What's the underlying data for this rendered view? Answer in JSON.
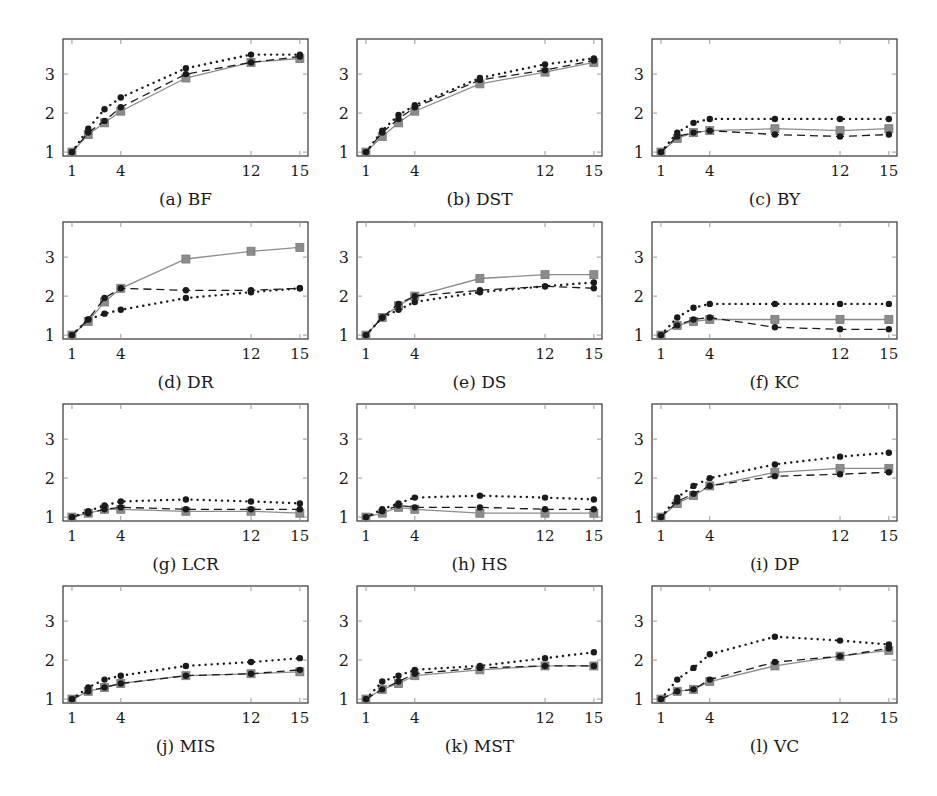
{
  "figure": {
    "layout": {
      "rows": 4,
      "cols": 3
    },
    "x_ticks": [
      1,
      4,
      12,
      15
    ],
    "y_ticks": [
      1,
      2,
      3
    ],
    "x_range": [
      0.45,
      15.5
    ],
    "y_range": [
      0.9,
      3.9
    ],
    "series_styles": [
      {
        "name": "series-solid",
        "line": "solid",
        "marker": "square",
        "color": "#8c8c8c"
      },
      {
        "name": "series-dashed",
        "line": "dashed",
        "marker": "circle",
        "color": "#1a1a1a"
      },
      {
        "name": "series-dotted",
        "line": "dotted",
        "marker": "circle",
        "color": "#1a1a1a"
      }
    ]
  },
  "chart_data": [
    {
      "type": "line",
      "title": "(a) BF",
      "xlabel": "",
      "ylabel": "",
      "xticks": [
        1,
        4,
        12,
        15
      ],
      "yticks": [
        1,
        2,
        3
      ],
      "ylim": [
        0.9,
        3.9
      ],
      "grid": false,
      "x": [
        1,
        2,
        3,
        4,
        8,
        12,
        15
      ],
      "series": [
        {
          "name": "solid-square",
          "values": [
            1.0,
            1.45,
            1.75,
            2.05,
            2.9,
            3.3,
            3.4
          ]
        },
        {
          "name": "dashed-circle",
          "values": [
            1.0,
            1.5,
            1.8,
            2.15,
            3.0,
            3.3,
            3.45
          ]
        },
        {
          "name": "dotted-circle",
          "values": [
            1.0,
            1.6,
            2.1,
            2.4,
            3.15,
            3.5,
            3.5
          ]
        }
      ]
    },
    {
      "type": "line",
      "title": "(b) DST",
      "xlabel": "",
      "ylabel": "",
      "xticks": [
        1,
        4,
        12,
        15
      ],
      "yticks": [
        1,
        2,
        3
      ],
      "ylim": [
        0.9,
        3.9
      ],
      "grid": false,
      "x": [
        1,
        2,
        3,
        4,
        8,
        12,
        15
      ],
      "series": [
        {
          "name": "solid-square",
          "values": [
            1.0,
            1.4,
            1.75,
            2.05,
            2.75,
            3.05,
            3.3
          ]
        },
        {
          "name": "dashed-circle",
          "values": [
            1.0,
            1.5,
            1.85,
            2.15,
            2.85,
            3.1,
            3.35
          ]
        },
        {
          "name": "dotted-circle",
          "values": [
            1.0,
            1.55,
            1.95,
            2.2,
            2.9,
            3.25,
            3.4
          ]
        }
      ]
    },
    {
      "type": "line",
      "title": "(c) BY",
      "xlabel": "",
      "ylabel": "",
      "xticks": [
        1,
        4,
        12,
        15
      ],
      "yticks": [
        1,
        2,
        3
      ],
      "ylim": [
        0.9,
        3.9
      ],
      "grid": false,
      "x": [
        1,
        2,
        3,
        4,
        8,
        12,
        15
      ],
      "series": [
        {
          "name": "solid-square",
          "values": [
            1.0,
            1.35,
            1.5,
            1.55,
            1.6,
            1.55,
            1.6
          ]
        },
        {
          "name": "dashed-circle",
          "values": [
            1.0,
            1.4,
            1.5,
            1.55,
            1.45,
            1.4,
            1.45
          ]
        },
        {
          "name": "dotted-circle",
          "values": [
            1.0,
            1.5,
            1.75,
            1.85,
            1.85,
            1.85,
            1.85
          ]
        }
      ]
    },
    {
      "type": "line",
      "title": "(d) DR",
      "xlabel": "",
      "ylabel": "",
      "xticks": [
        1,
        4,
        12,
        15
      ],
      "yticks": [
        1,
        2,
        3
      ],
      "ylim": [
        0.9,
        3.9
      ],
      "grid": false,
      "x": [
        1,
        2,
        3,
        4,
        8,
        12,
        15
      ],
      "series": [
        {
          "name": "solid-square",
          "values": [
            1.0,
            1.35,
            1.85,
            2.2,
            2.95,
            3.15,
            3.25
          ]
        },
        {
          "name": "dashed-circle",
          "values": [
            1.0,
            1.4,
            1.95,
            2.2,
            2.15,
            2.15,
            2.2
          ]
        },
        {
          "name": "dotted-circle",
          "values": [
            1.0,
            1.4,
            1.55,
            1.65,
            1.95,
            2.1,
            2.2
          ]
        }
      ]
    },
    {
      "type": "line",
      "title": "(e) DS",
      "xlabel": "",
      "ylabel": "",
      "xticks": [
        1,
        4,
        12,
        15
      ],
      "yticks": [
        1,
        2,
        3
      ],
      "ylim": [
        0.9,
        3.9
      ],
      "grid": false,
      "x": [
        1,
        2,
        3,
        4,
        8,
        12,
        15
      ],
      "series": [
        {
          "name": "solid-square",
          "values": [
            1.0,
            1.45,
            1.75,
            2.0,
            2.45,
            2.55,
            2.55
          ]
        },
        {
          "name": "dashed-circle",
          "values": [
            1.0,
            1.45,
            1.8,
            2.0,
            2.15,
            2.25,
            2.2
          ]
        },
        {
          "name": "dotted-circle",
          "values": [
            1.0,
            1.45,
            1.65,
            1.85,
            2.1,
            2.25,
            2.35
          ]
        }
      ]
    },
    {
      "type": "line",
      "title": "(f) KC",
      "xlabel": "",
      "ylabel": "",
      "xticks": [
        1,
        4,
        12,
        15
      ],
      "yticks": [
        1,
        2,
        3
      ],
      "ylim": [
        0.9,
        3.9
      ],
      "grid": false,
      "x": [
        1,
        2,
        3,
        4,
        8,
        12,
        15
      ],
      "series": [
        {
          "name": "solid-square",
          "values": [
            1.0,
            1.25,
            1.35,
            1.4,
            1.4,
            1.4,
            1.4
          ]
        },
        {
          "name": "dashed-circle",
          "values": [
            1.0,
            1.25,
            1.4,
            1.45,
            1.2,
            1.15,
            1.15
          ]
        },
        {
          "name": "dotted-circle",
          "values": [
            1.0,
            1.45,
            1.7,
            1.8,
            1.8,
            1.8,
            1.8
          ]
        }
      ]
    },
    {
      "type": "line",
      "title": "(g) LCR",
      "xlabel": "",
      "ylabel": "",
      "xticks": [
        1,
        4,
        12,
        15
      ],
      "yticks": [
        1,
        2,
        3
      ],
      "ylim": [
        0.9,
        3.9
      ],
      "grid": false,
      "x": [
        1,
        2,
        3,
        4,
        8,
        12,
        15
      ],
      "series": [
        {
          "name": "solid-square",
          "values": [
            1.0,
            1.1,
            1.2,
            1.2,
            1.15,
            1.15,
            1.1
          ]
        },
        {
          "name": "dashed-circle",
          "values": [
            1.0,
            1.1,
            1.2,
            1.25,
            1.2,
            1.2,
            1.2
          ]
        },
        {
          "name": "dotted-circle",
          "values": [
            1.0,
            1.15,
            1.3,
            1.4,
            1.45,
            1.4,
            1.35
          ]
        }
      ]
    },
    {
      "type": "line",
      "title": "(h) HS",
      "xlabel": "",
      "ylabel": "",
      "xticks": [
        1,
        4,
        12,
        15
      ],
      "yticks": [
        1,
        2,
        3
      ],
      "ylim": [
        0.9,
        3.9
      ],
      "grid": false,
      "x": [
        1,
        2,
        3,
        4,
        8,
        12,
        15
      ],
      "series": [
        {
          "name": "solid-square",
          "values": [
            1.0,
            1.1,
            1.25,
            1.2,
            1.1,
            1.1,
            1.1
          ]
        },
        {
          "name": "dashed-circle",
          "values": [
            1.0,
            1.15,
            1.3,
            1.25,
            1.25,
            1.2,
            1.2
          ]
        },
        {
          "name": "dotted-circle",
          "values": [
            1.0,
            1.2,
            1.35,
            1.5,
            1.55,
            1.5,
            1.45
          ]
        }
      ]
    },
    {
      "type": "line",
      "title": "(i) DP",
      "xlabel": "",
      "ylabel": "",
      "xticks": [
        1,
        4,
        12,
        15
      ],
      "yticks": [
        1,
        2,
        3
      ],
      "ylim": [
        0.9,
        3.9
      ],
      "grid": false,
      "x": [
        1,
        2,
        3,
        4,
        8,
        12,
        15
      ],
      "series": [
        {
          "name": "solid-square",
          "values": [
            1.0,
            1.35,
            1.55,
            1.8,
            2.15,
            2.25,
            2.25
          ]
        },
        {
          "name": "dashed-circle",
          "values": [
            1.0,
            1.4,
            1.6,
            1.8,
            2.05,
            2.1,
            2.15
          ]
        },
        {
          "name": "dotted-circle",
          "values": [
            1.0,
            1.5,
            1.8,
            2.0,
            2.35,
            2.55,
            2.65
          ]
        }
      ]
    },
    {
      "type": "line",
      "title": "(j) MIS",
      "xlabel": "",
      "ylabel": "",
      "xticks": [
        1,
        4,
        12,
        15
      ],
      "yticks": [
        1,
        2,
        3
      ],
      "ylim": [
        0.9,
        3.9
      ],
      "grid": false,
      "x": [
        1,
        2,
        3,
        4,
        8,
        12,
        15
      ],
      "series": [
        {
          "name": "solid-square",
          "values": [
            1.0,
            1.2,
            1.3,
            1.4,
            1.6,
            1.65,
            1.7
          ]
        },
        {
          "name": "dashed-circle",
          "values": [
            1.0,
            1.2,
            1.3,
            1.4,
            1.6,
            1.65,
            1.75
          ]
        },
        {
          "name": "dotted-circle",
          "values": [
            1.0,
            1.3,
            1.5,
            1.6,
            1.85,
            1.95,
            2.05
          ]
        }
      ]
    },
    {
      "type": "line",
      "title": "(k) MST",
      "xlabel": "",
      "ylabel": "",
      "xticks": [
        1,
        4,
        12,
        15
      ],
      "yticks": [
        1,
        2,
        3
      ],
      "ylim": [
        0.9,
        3.9
      ],
      "grid": false,
      "x": [
        1,
        2,
        3,
        4,
        8,
        12,
        15
      ],
      "series": [
        {
          "name": "solid-square",
          "values": [
            1.0,
            1.25,
            1.4,
            1.6,
            1.75,
            1.85,
            1.85
          ]
        },
        {
          "name": "dashed-circle",
          "values": [
            1.0,
            1.25,
            1.45,
            1.65,
            1.8,
            1.85,
            1.85
          ]
        },
        {
          "name": "dotted-circle",
          "values": [
            1.0,
            1.45,
            1.6,
            1.75,
            1.85,
            2.05,
            2.2
          ]
        }
      ]
    },
    {
      "type": "line",
      "title": "(l) VC",
      "xlabel": "",
      "ylabel": "",
      "xticks": [
        1,
        4,
        12,
        15
      ],
      "yticks": [
        1,
        2,
        3
      ],
      "ylim": [
        0.9,
        3.9
      ],
      "grid": false,
      "x": [
        1,
        2,
        3,
        4,
        8,
        12,
        15
      ],
      "series": [
        {
          "name": "solid-square",
          "values": [
            1.0,
            1.2,
            1.25,
            1.45,
            1.85,
            2.1,
            2.25
          ]
        },
        {
          "name": "dashed-circle",
          "values": [
            1.0,
            1.2,
            1.25,
            1.5,
            1.95,
            2.1,
            2.3
          ]
        },
        {
          "name": "dotted-circle",
          "values": [
            1.0,
            1.5,
            1.8,
            2.15,
            2.6,
            2.5,
            2.4
          ]
        }
      ]
    }
  ]
}
